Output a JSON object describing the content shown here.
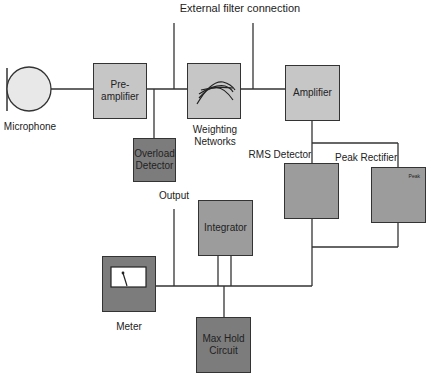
{
  "diagram": {
    "title": "External filter connection",
    "blocks": {
      "microphone": {
        "label": "Microphone"
      },
      "preamplifier": {
        "label_line1": "Pre-",
        "label_line2": "amplifier"
      },
      "overload_detector": {
        "label_line1": "Overload",
        "label_line2": "Detector"
      },
      "weighting_networks": {
        "label_line1": "Weighting",
        "label_line2": "Networks"
      },
      "amplifier": {
        "label": "Amplifier"
      },
      "rms_detector": {
        "label": "RMS Detector"
      },
      "peak_rectifier": {
        "label": "Peak Rectifier",
        "inner_label": "Peak"
      },
      "integrator": {
        "label": "Integrator"
      },
      "meter": {
        "label": "Meter"
      },
      "max_hold": {
        "label_line1": "Max Hold",
        "label_line2": "Circuit"
      }
    },
    "annotations": {
      "output": "Output"
    },
    "colors": {
      "light_block": "#c6c6c6",
      "medium_block": "#9c9c9c",
      "dark_block": "#7c7c7c",
      "line": "#333333"
    }
  }
}
